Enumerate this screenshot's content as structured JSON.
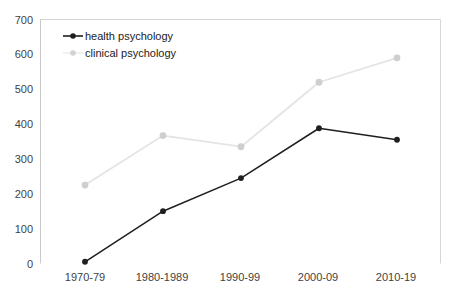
{
  "chart_data": {
    "type": "line",
    "title": "",
    "subtitle": "",
    "xlabel": "",
    "ylabel": "",
    "categories": [
      "1970-79",
      "1980-1989",
      "1990-99",
      "2000-09",
      "2010-19"
    ],
    "series": [
      {
        "name": "health psychology",
        "values": [
          5,
          150,
          245,
          388,
          355
        ],
        "color": "#1f1f1f",
        "marker": "circle"
      },
      {
        "name": "clinical psychology",
        "values": [
          225,
          367,
          335,
          520,
          590
        ],
        "color": "#d9d9d9",
        "marker": "circle"
      }
    ],
    "ylim": [
      0,
      700
    ],
    "yticks": [
      0,
      100,
      200,
      300,
      400,
      500,
      600,
      700
    ],
    "ytick_labels": [
      "0",
      "100",
      "200",
      "300",
      "400",
      "500",
      "600",
      "700"
    ],
    "grid": false,
    "legend_position": "top-left",
    "legend_entries": [
      "health psychology",
      "clinical psychology"
    ]
  },
  "axes": {
    "y_tick_labels": [
      "700",
      "600",
      "500",
      "400",
      "300",
      "200",
      "100",
      "0"
    ],
    "x_tick_labels": [
      "1970-79",
      "1980-1989",
      "1990-99",
      "2000-09",
      "2010-19"
    ]
  },
  "legend": {
    "items": [
      {
        "label": "health psychology",
        "color": "#1f1f1f"
      },
      {
        "label": "clinical psychology",
        "color": "#d9d9d9"
      }
    ]
  },
  "colors": {
    "health_series": "#1f1f1f",
    "clinical_series": "#d9d9d9",
    "clinical_marker": "#b8b8b8",
    "axis": "#c9c9c9",
    "frame": "#d6d6d6",
    "text": "#3f3f3f",
    "background": "#ffffff"
  }
}
